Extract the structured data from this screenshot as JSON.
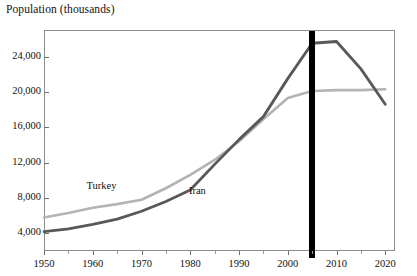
{
  "chart_data": {
    "type": "line",
    "title": "Population (thousands)",
    "xlabel": "",
    "ylabel": "Population (thousands)",
    "xlim": [
      1950,
      2022
    ],
    "ylim": [
      2000,
      27000
    ],
    "grid": false,
    "legend_position": "inline-labels",
    "y_ticks": [
      4000,
      8000,
      12000,
      16000,
      20000,
      24000
    ],
    "y_tick_labels": [
      "4,000",
      "8,000",
      "12,000",
      "16,000",
      "20,000",
      "24,000"
    ],
    "x_ticks": [
      1950,
      1960,
      1970,
      1980,
      1990,
      2000,
      2010,
      2020
    ],
    "x_tick_labels": [
      "1950",
      "1960",
      "1970",
      "1980",
      "1990",
      "2000",
      "2010",
      "2020"
    ],
    "x_minor_ticks": [
      1955,
      1965,
      1975,
      1985,
      1995,
      2005,
      2015
    ],
    "x": [
      1950,
      1955,
      1960,
      1965,
      1970,
      1975,
      1980,
      1985,
      1990,
      1995,
      2000,
      2005,
      2010,
      2015,
      2020
    ],
    "series": [
      {
        "name": "Turkey",
        "color": "#b4b4b4",
        "label_x": 1962,
        "label_y": 9300,
        "values": [
          5800,
          6300,
          6900,
          7300,
          7800,
          9100,
          10600,
          12300,
          14400,
          16900,
          19300,
          20100,
          20200,
          20200,
          20300
        ]
      },
      {
        "name": "Iran",
        "color": "#585858",
        "label_x": 1983,
        "label_y": 8700,
        "values": [
          4200,
          4500,
          5000,
          5600,
          6500,
          7600,
          8900,
          11800,
          14600,
          17200,
          21500,
          25500,
          25700,
          22600,
          18600
        ]
      }
    ],
    "annotations": [
      {
        "type": "vertical-bar",
        "name": "year-marker-2005",
        "x": 2005,
        "color": "#000000",
        "width_px": 6
      }
    ]
  },
  "labels": {
    "turkey": "Turkey",
    "iran": "Iran"
  }
}
